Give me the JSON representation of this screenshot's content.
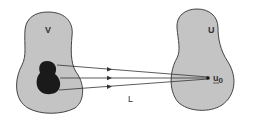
{
  "diagram": {
    "left_region_label": "V",
    "right_region_label": "U",
    "point_label": "u",
    "point_subscript": "0",
    "map_label": "L",
    "colors": {
      "region_fill": "#c4c4c4",
      "outline": "#444444",
      "subset_fill": "#1a1a1a",
      "arrow": "#333333"
    }
  }
}
